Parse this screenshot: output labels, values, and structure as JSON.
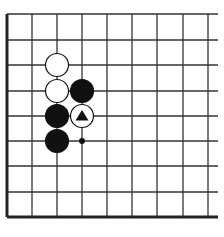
{
  "board": {
    "grid": {
      "x": [
        7,
        32,
        57,
        82,
        107,
        132,
        157,
        183,
        208
      ],
      "y": [
        14,
        40,
        65,
        91,
        116,
        141,
        166,
        192,
        217
      ],
      "right_extent": 218,
      "top_extent": 14,
      "line_color": "#333333",
      "edge_color": "#222222"
    },
    "edges": [
      "left",
      "bottom"
    ],
    "stone_radius": 11.5,
    "stones": [
      {
        "color": "white",
        "col": 2,
        "row": 2,
        "mark": null
      },
      {
        "color": "white",
        "col": 2,
        "row": 3,
        "mark": null
      },
      {
        "color": "black",
        "col": 3,
        "row": 3,
        "mark": null
      },
      {
        "color": "black",
        "col": 2,
        "row": 4,
        "mark": null
      },
      {
        "color": "white",
        "col": 3,
        "row": 4,
        "mark": "triangle"
      },
      {
        "color": "black",
        "col": 2,
        "row": 5,
        "mark": null
      }
    ],
    "points": [
      {
        "col": 3,
        "row": 5,
        "mark": "dot"
      }
    ]
  },
  "caption": ""
}
